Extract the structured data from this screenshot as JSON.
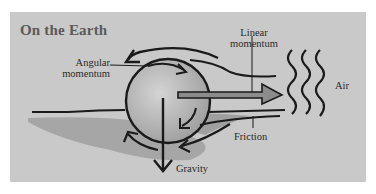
{
  "diagram": {
    "title": "On the Earth",
    "labels": {
      "angular_momentum_line1": "Angular",
      "angular_momentum_line2": "momentum",
      "linear_momentum_line1": "Linear",
      "linear_momentum_line2": "momentum",
      "air": "Air",
      "friction": "Friction",
      "gravity": "Gravity"
    },
    "colors": {
      "panel": "#c9c9c9",
      "ink": "#1a1a1a",
      "title": "#5a5a5a",
      "sphere": "#b8b8b8",
      "ground_shade": "#8a8a8a"
    }
  }
}
